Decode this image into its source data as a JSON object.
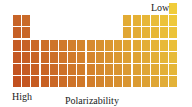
{
  "figure": {
    "title": "Polarizability",
    "legend_low": "Low",
    "legend_high": "High",
    "layout": {
      "columns": 18,
      "rows": 7,
      "origin_x": 13,
      "origin_y": 3,
      "pitch_x": 9.2,
      "pitch_y": 12.2
    },
    "colors": {
      "high_left_bottom": "#c2501f",
      "high_left_top": "#c8682a",
      "middle": "#d8922e",
      "low_right_bottom": "#e3b238",
      "low_right_top": "#f0cc3a"
    },
    "occupied": [
      {
        "row": 1,
        "cols": [
          18
        ]
      },
      {
        "row": 2,
        "cols": [
          1,
          2,
          13,
          14,
          15,
          16,
          17,
          18
        ]
      },
      {
        "row": 3,
        "cols": [
          1,
          2,
          13,
          14,
          15,
          16,
          17,
          18
        ]
      },
      {
        "row": 4,
        "cols": [
          1,
          2,
          3,
          4,
          5,
          6,
          7,
          8,
          9,
          10,
          11,
          12,
          13,
          14,
          15,
          16,
          17,
          18
        ]
      },
      {
        "row": 5,
        "cols": [
          1,
          2,
          3,
          4,
          5,
          6,
          7,
          8,
          9,
          10,
          11,
          12,
          13,
          14,
          15,
          16,
          17,
          18
        ]
      },
      {
        "row": 6,
        "cols": [
          1,
          2,
          3,
          4,
          5,
          6,
          7,
          8,
          9,
          10,
          11,
          12,
          13,
          14,
          15,
          16,
          17,
          18
        ]
      },
      {
        "row": 7,
        "cols": [
          1,
          2,
          3,
          4,
          5,
          6,
          7,
          8,
          9,
          10,
          11,
          12,
          13,
          14,
          15,
          16,
          17,
          18
        ]
      }
    ]
  }
}
